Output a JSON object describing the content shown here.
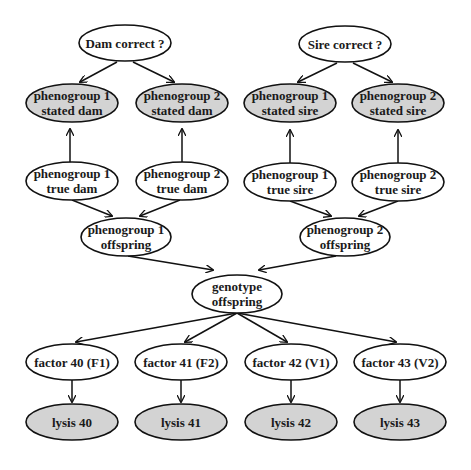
{
  "diagram": {
    "title": "",
    "colors": {
      "observed_fill": "#d3d3d3",
      "latent_fill": "#ffffff",
      "stroke": "#111111",
      "text": "#1a1a1a"
    },
    "nodes": [
      {
        "id": "dam_correct",
        "lines": [
          "Dam correct ?"
        ],
        "cx": 125,
        "cy": 43,
        "rx": 46,
        "ry": 18,
        "type": "latent"
      },
      {
        "id": "sire_correct",
        "lines": [
          "Sire correct ?"
        ],
        "cx": 345,
        "cy": 44,
        "rx": 46,
        "ry": 18,
        "type": "latent"
      },
      {
        "id": "pg1_stated_dam",
        "lines": [
          "phenogroup 1",
          "stated dam"
        ],
        "cx": 72,
        "cy": 103,
        "rx": 46,
        "ry": 19,
        "type": "observed"
      },
      {
        "id": "pg2_stated_dam",
        "lines": [
          "phenogroup 2",
          "stated dam"
        ],
        "cx": 182,
        "cy": 103,
        "rx": 46,
        "ry": 19,
        "type": "observed"
      },
      {
        "id": "pg1_stated_sire",
        "lines": [
          "phenogroup 1",
          "stated sire"
        ],
        "cx": 290,
        "cy": 103,
        "rx": 46,
        "ry": 19,
        "type": "observed"
      },
      {
        "id": "pg2_stated_sire",
        "lines": [
          "phenogroup 2",
          "stated sire"
        ],
        "cx": 398,
        "cy": 103,
        "rx": 46,
        "ry": 19,
        "type": "observed"
      },
      {
        "id": "pg1_true_dam",
        "lines": [
          "phenogroup 1",
          "true dam"
        ],
        "cx": 72,
        "cy": 181,
        "rx": 46,
        "ry": 19,
        "type": "latent"
      },
      {
        "id": "pg2_true_dam",
        "lines": [
          "phenogroup 2",
          "true dam"
        ],
        "cx": 182,
        "cy": 181,
        "rx": 46,
        "ry": 19,
        "type": "latent"
      },
      {
        "id": "pg1_true_sire",
        "lines": [
          "phenogroup 1",
          "true sire"
        ],
        "cx": 290,
        "cy": 182,
        "rx": 46,
        "ry": 19,
        "type": "latent"
      },
      {
        "id": "pg2_true_sire",
        "lines": [
          "phenogroup 2",
          "true sire"
        ],
        "cx": 398,
        "cy": 182,
        "rx": 46,
        "ry": 19,
        "type": "latent"
      },
      {
        "id": "pg1_offspring",
        "lines": [
          "phenogroup 1",
          "offspring"
        ],
        "cx": 126,
        "cy": 237,
        "rx": 45,
        "ry": 19,
        "type": "latent"
      },
      {
        "id": "pg2_offspring",
        "lines": [
          "phenogroup 2",
          "offspring"
        ],
        "cx": 345,
        "cy": 237,
        "rx": 45,
        "ry": 19,
        "type": "latent"
      },
      {
        "id": "genotype_offspring",
        "lines": [
          "genotype",
          "offspring"
        ],
        "cx": 237,
        "cy": 294,
        "rx": 45,
        "ry": 19,
        "type": "latent"
      },
      {
        "id": "factor40",
        "lines": [
          "factor 40 (F1)"
        ],
        "cx": 72,
        "cy": 362,
        "rx": 46,
        "ry": 18,
        "type": "latent"
      },
      {
        "id": "factor41",
        "lines": [
          "factor 41 (F2)"
        ],
        "cx": 181,
        "cy": 362,
        "rx": 46,
        "ry": 18,
        "type": "latent"
      },
      {
        "id": "factor42",
        "lines": [
          "factor 42 (V1)"
        ],
        "cx": 291,
        "cy": 362,
        "rx": 46,
        "ry": 18,
        "type": "latent"
      },
      {
        "id": "factor43",
        "lines": [
          "factor 43 (V2)"
        ],
        "cx": 400,
        "cy": 362,
        "rx": 46,
        "ry": 18,
        "type": "latent"
      },
      {
        "id": "lysis40",
        "lines": [
          "lysis 40"
        ],
        "cx": 72,
        "cy": 422,
        "rx": 46,
        "ry": 18,
        "type": "observed"
      },
      {
        "id": "lysis41",
        "lines": [
          "lysis 41"
        ],
        "cx": 181,
        "cy": 422,
        "rx": 46,
        "ry": 18,
        "type": "observed"
      },
      {
        "id": "lysis42",
        "lines": [
          "lysis 42"
        ],
        "cx": 291,
        "cy": 422,
        "rx": 46,
        "ry": 18,
        "type": "observed"
      },
      {
        "id": "lysis43",
        "lines": [
          "lysis 43"
        ],
        "cx": 400,
        "cy": 422,
        "rx": 46,
        "ry": 18,
        "type": "observed"
      }
    ],
    "edges": [
      {
        "from": "dam_correct",
        "to": "pg1_stated_dam",
        "x1": 117,
        "y1": 62,
        "x2": 80,
        "y2": 82
      },
      {
        "from": "dam_correct",
        "to": "pg2_stated_dam",
        "x1": 133,
        "y1": 62,
        "x2": 174,
        "y2": 82
      },
      {
        "from": "sire_correct",
        "to": "pg1_stated_sire",
        "x1": 337,
        "y1": 63,
        "x2": 298,
        "y2": 82
      },
      {
        "from": "sire_correct",
        "to": "pg2_stated_sire",
        "x1": 353,
        "y1": 63,
        "x2": 392,
        "y2": 82
      },
      {
        "from": "pg1_true_dam",
        "to": "pg1_stated_dam",
        "x1": 70,
        "y1": 162,
        "x2": 70,
        "y2": 129
      },
      {
        "from": "pg2_true_dam",
        "to": "pg2_stated_dam",
        "x1": 182,
        "y1": 162,
        "x2": 182,
        "y2": 129
      },
      {
        "from": "pg1_true_sire",
        "to": "pg1_stated_sire",
        "x1": 290,
        "y1": 163,
        "x2": 290,
        "y2": 130
      },
      {
        "from": "pg2_true_sire",
        "to": "pg2_stated_sire",
        "x1": 398,
        "y1": 163,
        "x2": 398,
        "y2": 130
      },
      {
        "from": "pg1_true_dam",
        "to": "pg1_offspring",
        "x1": 72,
        "y1": 200,
        "x2": 112,
        "y2": 216
      },
      {
        "from": "pg2_true_dam",
        "to": "pg1_offspring",
        "x1": 180,
        "y1": 200,
        "x2": 140,
        "y2": 216
      },
      {
        "from": "pg1_true_sire",
        "to": "pg2_offspring",
        "x1": 290,
        "y1": 201,
        "x2": 331,
        "y2": 216
      },
      {
        "from": "pg2_true_sire",
        "to": "pg2_offspring",
        "x1": 398,
        "y1": 201,
        "x2": 359,
        "y2": 216
      },
      {
        "from": "pg1_offspring",
        "to": "genotype_offspring",
        "x1": 128,
        "y1": 256,
        "x2": 213,
        "y2": 270
      },
      {
        "from": "pg2_offspring",
        "to": "genotype_offspring",
        "x1": 336,
        "y1": 256,
        "x2": 259,
        "y2": 270
      },
      {
        "from": "genotype_offspring",
        "to": "factor40",
        "x1": 237,
        "y1": 313,
        "x2": 76,
        "y2": 342
      },
      {
        "from": "genotype_offspring",
        "to": "factor41",
        "x1": 237,
        "y1": 313,
        "x2": 185,
        "y2": 342
      },
      {
        "from": "genotype_offspring",
        "to": "factor42",
        "x1": 237,
        "y1": 313,
        "x2": 287,
        "y2": 342
      },
      {
        "from": "genotype_offspring",
        "to": "factor43",
        "x1": 237,
        "y1": 313,
        "x2": 396,
        "y2": 342
      },
      {
        "from": "factor40",
        "to": "lysis40",
        "x1": 72,
        "y1": 380,
        "x2": 72,
        "y2": 402
      },
      {
        "from": "factor41",
        "to": "lysis41",
        "x1": 181,
        "y1": 380,
        "x2": 181,
        "y2": 402
      },
      {
        "from": "factor42",
        "to": "lysis42",
        "x1": 291,
        "y1": 380,
        "x2": 291,
        "y2": 402
      },
      {
        "from": "factor43",
        "to": "lysis43",
        "x1": 400,
        "y1": 380,
        "x2": 400,
        "y2": 402
      }
    ]
  }
}
